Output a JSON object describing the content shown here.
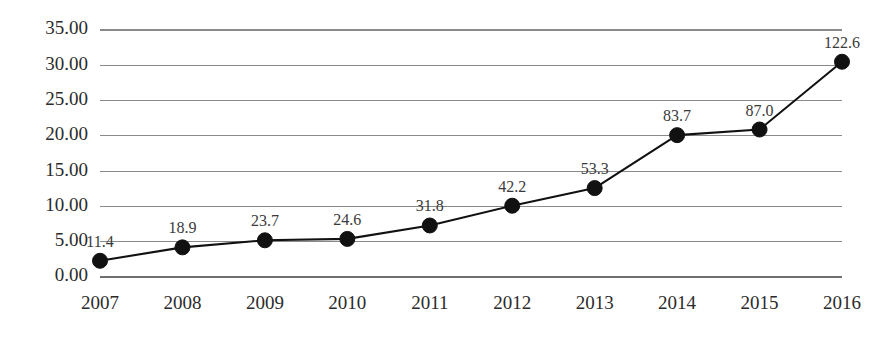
{
  "chart_data": {
    "type": "line",
    "title": "",
    "subtitle": "",
    "xlabel": "",
    "ylabel": "",
    "categories": [
      "2007",
      "2008",
      "2009",
      "2010",
      "2011",
      "2012",
      "2013",
      "2014",
      "2015",
      "2016"
    ],
    "values": [
      2.3,
      4.2,
      5.2,
      5.4,
      7.3,
      10.1,
      12.6,
      20.1,
      20.9,
      30.5
    ],
    "point_labels": [
      "11.4",
      "18.9",
      "23.7",
      "24.6",
      "31.8",
      "42.2",
      "53.3",
      "83.7",
      "87.0",
      "122.6"
    ],
    "ylim": [
      0,
      35
    ],
    "ytick_values": [
      0,
      5,
      10,
      15,
      20,
      25,
      30,
      35
    ],
    "ytick_labels": [
      "0.00",
      "5.00",
      "10.00",
      "15.00",
      "20.00",
      "25.00",
      "30.00",
      "35.00"
    ],
    "grid": true,
    "legend": false,
    "legend_position": "none",
    "series": [
      {
        "name": "series-1",
        "values": [
          2.3,
          4.2,
          5.2,
          5.4,
          7.3,
          10.1,
          12.6,
          20.1,
          20.9,
          30.5
        ],
        "labels": [
          "11.4",
          "18.9",
          "23.7",
          "24.6",
          "31.8",
          "42.2",
          "53.3",
          "83.7",
          "87.0",
          "122.6"
        ],
        "line_color": "#111111",
        "marker_color": "#111111",
        "marker": "circle"
      }
    ],
    "colors": {
      "line": "#111111",
      "marker": "#111111",
      "grid": "#8a8a8a",
      "axis_text": "#2b2b2b",
      "label_text": "#3a3a3a",
      "background": "#ffffff"
    }
  },
  "layout": {
    "plot_left": 100,
    "plot_right": 842,
    "plot_top": 30,
    "plot_bottom": 277,
    "x_label_y": 305,
    "point_label_offset": 14,
    "marker_radius": 7.5
  }
}
